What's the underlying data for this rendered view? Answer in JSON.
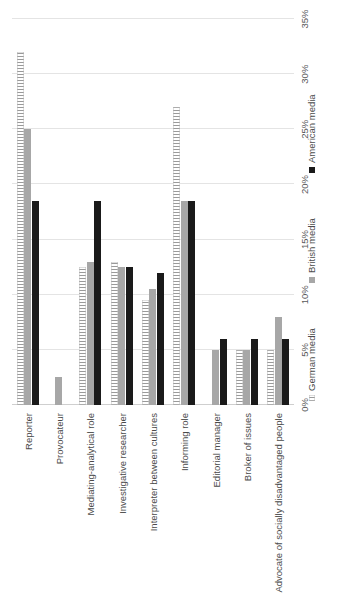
{
  "chart_data": {
    "type": "bar",
    "title": "",
    "xlabel": "",
    "ylabel": "",
    "orientation": "vertical",
    "grid": true,
    "legend_position": "bottom",
    "ylim": [
      0,
      35
    ],
    "tick_labels": [
      "0%",
      "5%",
      "10%",
      "15%",
      "20%",
      "25%",
      "30%",
      "35%"
    ],
    "tick_values": [
      0,
      5,
      10,
      15,
      20,
      25,
      30,
      35
    ],
    "categories": [
      "Reporter",
      "Provocateur",
      "Mediating-analytical role",
      "Investigative researcher",
      "Interpreter between cultures",
      "Informing role",
      "Editorial manager",
      "Broker of issues",
      "Advocate of socially disadvantaged people"
    ],
    "series": [
      {
        "name": "German media",
        "color": "#f2f2f2",
        "pattern": "hatched",
        "values": [
          32.0,
          0.0,
          12.5,
          13.0,
          9.5,
          27.0,
          0.0,
          5.0,
          5.0
        ]
      },
      {
        "name": "British media",
        "color": "#a7a7a7",
        "pattern": "solid",
        "values": [
          25.0,
          2.5,
          13.0,
          12.5,
          10.5,
          18.5,
          5.0,
          5.0,
          8.0
        ]
      },
      {
        "name": "American media",
        "color": "#1a1a1a",
        "pattern": "solid",
        "values": [
          18.5,
          0.0,
          18.5,
          12.5,
          12.0,
          18.5,
          6.0,
          6.0,
          6.0
        ]
      }
    ]
  },
  "legend": {
    "items": [
      {
        "label": "German media"
      },
      {
        "label": "British media"
      },
      {
        "label": "American media"
      }
    ]
  }
}
